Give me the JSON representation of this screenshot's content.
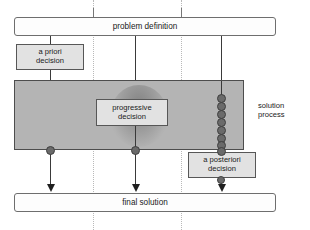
{
  "diagram": {
    "title_box": {
      "label": "problem definition"
    },
    "bottom_box": {
      "label": "final solution"
    },
    "side_label": {
      "line1": "solution",
      "line2": "process"
    },
    "decisions": [
      {
        "id": "a-priori",
        "line1": "a priori",
        "line2": "decision"
      },
      {
        "id": "progressive",
        "line1": "progressive",
        "line2": "decision"
      },
      {
        "id": "a-posteriori",
        "line1": "a posteriori",
        "line2": "decision"
      }
    ],
    "colors": {
      "band_fill": "#b4b4b4",
      "band_stroke": "#4d4d4d",
      "decision_fill": "#e2e2e2",
      "decision_stroke": "#575757",
      "open_box_fill": "#fdfdfd",
      "open_box_stroke": "#6e6e6e",
      "connector": "#3a3a3a",
      "node_dot": "#6a6a6a",
      "guide_dotted": "#b9b9b9",
      "text": "#1a1a1a"
    },
    "iteration_nodes": {
      "count": 8,
      "description": "stacked iteration markers on the a posteriori branch"
    }
  }
}
